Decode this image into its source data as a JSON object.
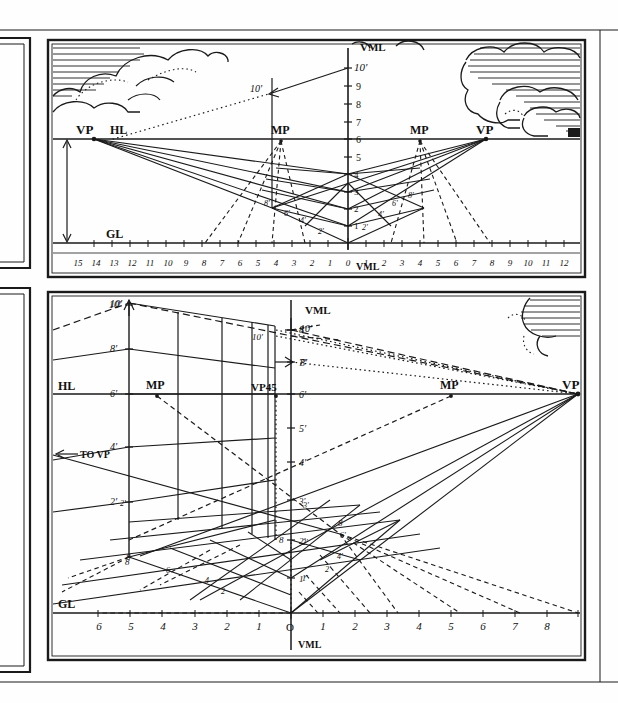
{
  "sheet": {
    "title": "Two-plate perspective construction drawing",
    "background_color": "#fefefe",
    "ink_color": "#1a1a1a",
    "width": 618,
    "height": 703
  },
  "partial_frames_left": [
    {
      "name": "upper-left-partial-frame"
    },
    {
      "name": "lower-left-partial-frame"
    }
  ],
  "plates": [
    {
      "id": "upper-plate",
      "name": "two-point-perspective-plate",
      "frame": {
        "x": 48,
        "y": 40,
        "w": 537,
        "h": 237
      },
      "has_sky": true,
      "labels": {
        "hl": "HL",
        "gl": "GL",
        "vml_top": "VML",
        "vml_bottom": "VML",
        "vp_left": "VP",
        "vp_right": "VP",
        "mp_left": "MP",
        "mp_right": "MP",
        "height_marker": "10'",
        "height_marker_left": "10'"
      },
      "vml_scale": {
        "name": "vertical-measuring-line-scale",
        "ticks": [
          "1",
          "2",
          "3",
          "4",
          "5",
          "6",
          "7",
          "8",
          "9",
          "10'"
        ],
        "top_label": "10'",
        "hl_level": "6"
      },
      "ground_line_scale": {
        "name": "ground-line-scale",
        "left_values": [
          "15",
          "14",
          "13",
          "12",
          "11",
          "10",
          "9",
          "8",
          "7",
          "6",
          "5",
          "4",
          "3",
          "2",
          "1"
        ],
        "origin": "0",
        "right_values": [
          "1",
          "2",
          "3",
          "4",
          "5",
          "6",
          "7",
          "8",
          "9",
          "10",
          "11",
          "12"
        ]
      },
      "grid_labels_left": [
        "2'",
        "4'",
        "6'",
        "8'"
      ],
      "grid_labels_right": [
        "2'",
        "4'",
        "6'",
        "8'"
      ],
      "grid_labels_vertical": [
        "1",
        "2",
        "3",
        "4"
      ]
    },
    {
      "id": "lower-plate",
      "name": "one-point-and-45-degree-perspective-plate",
      "frame": {
        "x": 48,
        "y": 292,
        "w": 537,
        "h": 368
      },
      "has_sky": true,
      "labels": {
        "hl": "HL",
        "gl": "GL",
        "vml_top": "VML",
        "vml_bottom": "VML",
        "vp_right": "VP",
        "vp45": "VP45",
        "mp_left": "MP",
        "mp_right": "MP",
        "to_vp": "TO VP",
        "height_near": "10'",
        "height_far": "10'",
        "height_right": "10'",
        "height_eight": "8'"
      },
      "left_vertical_scale": {
        "name": "left-measuring-line-scale",
        "ticks": [
          "2'",
          "4'",
          "6'",
          "8'",
          "10'"
        ],
        "base": "8"
      },
      "vml_scale": {
        "name": "vertical-measuring-line-scale",
        "ticks": [
          "1'",
          "2'",
          "3'",
          "4'",
          "5'",
          "6'",
          "7'",
          "8'"
        ],
        "origin": "O",
        "base_mark": "8"
      },
      "ground_line_scale": {
        "name": "ground-line-scale",
        "left_values": [
          "6",
          "5",
          "4",
          "3",
          "2",
          "1"
        ],
        "origin": "O",
        "right_values": [
          "1",
          "2",
          "3",
          "4",
          "5",
          "6",
          "7",
          "8"
        ]
      },
      "grid_labels_left": [
        "2'",
        "4'",
        "6'",
        "8"
      ],
      "grid_labels_center": [
        "2",
        "4",
        "6",
        "8"
      ],
      "grid_labels_right": [
        "1'",
        "2'",
        "3'",
        "2'",
        "4'",
        "6'",
        "8"
      ]
    }
  ]
}
